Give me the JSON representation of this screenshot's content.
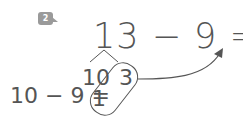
{
  "problem": {
    "number": "2",
    "equation": "13 − 9 = 4"
  },
  "decomposition": {
    "tens": "10",
    "ones": "3"
  },
  "sub_step": {
    "equation": "10 − 9 =",
    "result": "1"
  },
  "colors": {
    "ink": "#555555",
    "badge": "#9a9a9a"
  }
}
